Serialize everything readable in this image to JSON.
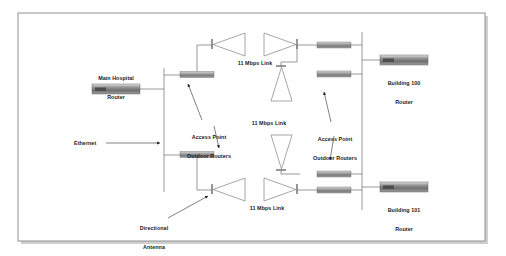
{
  "diagram": {
    "frame": {
      "color": "#9a9a9a",
      "shadow_color": "#c8c8c8"
    },
    "colors": {
      "line": "#7d7d7d",
      "text": "#1b1b1b",
      "device_dark": "#6e6e6e",
      "device_light": "#d8d8d8",
      "antenna_stroke": "#8a8a8a"
    },
    "nodes": [
      {
        "id": "main-hospital-router",
        "label": "Main Hospital\nRouter",
        "type": "router"
      },
      {
        "id": "building-100-router",
        "label": "Building 100\nRouter",
        "type": "router"
      },
      {
        "id": "building-101-router",
        "label": "Building 101\nRouter",
        "type": "router"
      }
    ],
    "annotations": [
      {
        "id": "ethernet",
        "label": "Ethernet"
      },
      {
        "id": "access-point-outdoor-routers-left",
        "label": "Access Point\nOutdoor Routers"
      },
      {
        "id": "access-point-outdoor-routers-right",
        "label": "Access Point\nOutdoor Routers"
      },
      {
        "id": "directional-antenna",
        "label": "Directional\nAntenna"
      }
    ],
    "links": [
      {
        "id": "link-top",
        "label": "11 Mbps Link",
        "rate": "11 Mbps"
      },
      {
        "id": "link-center",
        "label": "11 Mbps Link",
        "rate": "11 Mbps"
      },
      {
        "id": "link-bottom",
        "label": "11 Mbps Link",
        "rate": "11 Mbps"
      }
    ],
    "labels": {
      "main_hospital_router_line1": "Main Hospital",
      "main_hospital_router_line2": "Router",
      "building_100_line1": "Building 100",
      "building_100_line2": "Router",
      "building_101_line1": "Building 101",
      "building_101_line2": "Router",
      "ethernet": "Ethernet",
      "access_point_left_line1": "Access Point",
      "access_point_left_line2": "Outdoor Routers",
      "access_point_right_line1": "Access Point",
      "access_point_right_line2": "Outdoor Routers",
      "directional_antenna_line1": "Directional",
      "directional_antenna_line2": "Antenna",
      "link_top": "11 Mbps Link",
      "link_center": "11 Mbps Link",
      "link_bottom": "11 Mbps Link"
    }
  }
}
